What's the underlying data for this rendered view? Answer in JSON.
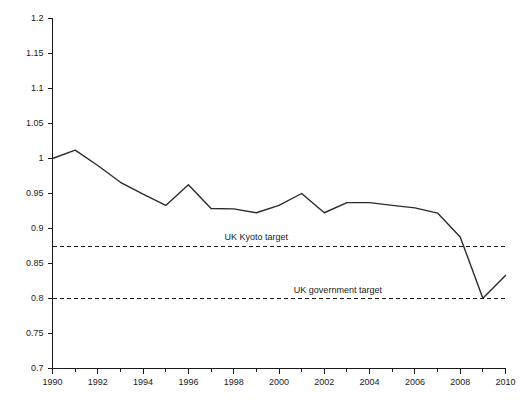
{
  "chart_data": {
    "type": "line",
    "title": "",
    "xlabel": "",
    "ylabel": "",
    "xlim": [
      1990,
      2010
    ],
    "ylim": [
      0.7,
      1.2
    ],
    "grid": false,
    "legend": "none",
    "x": [
      1990,
      1991,
      1992,
      1993,
      1994,
      1995,
      1996,
      1997,
      1998,
      1999,
      2000,
      2001,
      2002,
      2003,
      2004,
      2005,
      2006,
      2007,
      2008,
      2009,
      2010
    ],
    "series": [
      {
        "name": "UK emissions index",
        "values": [
          1.0,
          1.012,
          0.99,
          0.966,
          0.949,
          0.933,
          0.9625,
          0.9285,
          0.928,
          0.9225,
          0.933,
          0.95,
          0.9225,
          0.937,
          0.937,
          0.933,
          0.9295,
          0.922,
          0.888,
          0.8005,
          0.833
        ]
      }
    ],
    "xticks": [
      1990,
      1992,
      1994,
      1996,
      1998,
      2000,
      2002,
      2004,
      2006,
      2008,
      2010
    ],
    "xtick_labels": [
      "1990",
      "1992",
      "1994",
      "1996",
      "1998",
      "2000",
      "2002",
      "2004",
      "2006",
      "2008",
      "2010"
    ],
    "xminorticks": [
      1991,
      1993,
      1995,
      1997,
      1999,
      2001,
      2003,
      2005,
      2007,
      2009
    ],
    "yticks": [
      0.7,
      0.75,
      0.8,
      0.85,
      0.9,
      0.95,
      1.0,
      1.05,
      1.1,
      1.15,
      1.2
    ],
    "ytick_labels": [
      "0.7",
      "0.75",
      "0.8",
      "0.85",
      "0.9",
      "0.95",
      "1",
      "1.05",
      "1.1",
      "1.15",
      "1.2"
    ],
    "reference_lines": [
      {
        "label": "UK Kyoto target",
        "value": 0.875,
        "label_x": 1999.0,
        "style": "dashed"
      },
      {
        "label": "UK government target",
        "value": 0.8,
        "label_x": 2002.6,
        "style": "dashed"
      }
    ]
  },
  "colors": {
    "series": "#2b2b2b",
    "axis": "#1a1a1a",
    "background": "#ffffff",
    "reference": "#1a1a1a"
  }
}
